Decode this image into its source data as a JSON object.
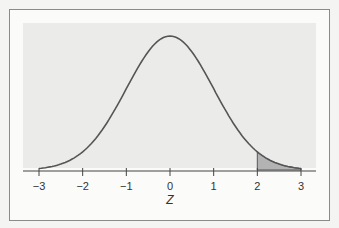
{
  "chart_data": {
    "type": "area",
    "title": "",
    "xlabel": "Z",
    "ylabel": "",
    "x_ticks": [
      -3,
      -2,
      -1,
      0,
      1,
      2,
      3
    ],
    "x_tick_labels": [
      "−3",
      "−2",
      "−1",
      "0",
      "1",
      "2",
      "3"
    ],
    "xlim": [
      -3,
      3
    ],
    "curve": "standard normal density",
    "series": [
      {
        "name": "standard normal pdf",
        "x": [
          -3,
          -2.5,
          -2,
          -1.5,
          -1,
          -0.5,
          0,
          0.5,
          1,
          1.5,
          2,
          2.5,
          3
        ],
        "y": [
          0.0044,
          0.0175,
          0.054,
          0.1295,
          0.242,
          0.3521,
          0.3989,
          0.3521,
          0.242,
          0.1295,
          0.054,
          0.0175,
          0.0044
        ]
      }
    ],
    "shaded_region": {
      "from": 2,
      "to": 3,
      "color": "#b3b3b3"
    },
    "grid": false,
    "legend": null
  },
  "colors": {
    "plot_bg": "#ebebea",
    "curve": "#555555",
    "shade": "#b3b3b3",
    "axis": "#444444"
  }
}
